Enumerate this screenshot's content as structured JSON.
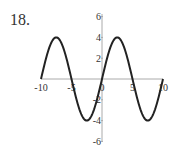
{
  "problem": {
    "number": "18."
  },
  "chart_data": {
    "type": "line",
    "title": "",
    "xlabel": "",
    "ylabel": "",
    "function": "y = 4 sin(pi x / 5)",
    "xlim": [
      -10,
      10
    ],
    "ylim": [
      -6,
      6
    ],
    "x_ticks": [
      "-10",
      "-5",
      "0",
      "5",
      "10"
    ],
    "y_ticks": [
      "6",
      "4",
      "2",
      "-2",
      "-4",
      "-6"
    ],
    "grid": false,
    "series": [
      {
        "name": "curve",
        "x": [
          -10,
          -7.5,
          -5,
          -2.5,
          0,
          2.5,
          5,
          7.5,
          10
        ],
        "y": [
          0,
          4,
          0,
          -4,
          0,
          4,
          0,
          -4,
          0
        ]
      }
    ],
    "colors": {
      "curve": "#222222",
      "axis": "#aaaaaa"
    }
  }
}
